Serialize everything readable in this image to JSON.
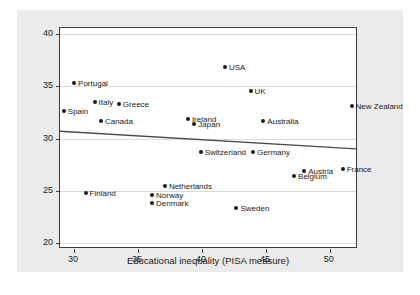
{
  "chart_data": {
    "type": "scatter",
    "title": "",
    "xlabel": "Educational inequality (PISA measure)",
    "ylabel": "Social inequality (Gini index)",
    "xlim": [
      28.9,
      52.2
    ],
    "ylim": [
      19.4,
      40.6
    ],
    "xticks": [
      30,
      35,
      40,
      45,
      50
    ],
    "yticks": [
      20,
      25,
      30,
      35,
      40
    ],
    "grid": "horizontal",
    "legend": "none",
    "points": [
      {
        "label": "Portugal",
        "x": 30.0,
        "y": 35.3,
        "side": "right"
      },
      {
        "label": "Spain",
        "x": 29.2,
        "y": 32.6,
        "side": "right"
      },
      {
        "label": "Italy",
        "x": 31.6,
        "y": 33.5,
        "side": "right"
      },
      {
        "label": "Greece",
        "x": 33.5,
        "y": 33.3,
        "side": "right"
      },
      {
        "label": "Canada",
        "x": 32.1,
        "y": 31.7,
        "side": "right"
      },
      {
        "label": "USA",
        "x": 41.8,
        "y": 36.9,
        "side": "right"
      },
      {
        "label": "UK",
        "x": 43.8,
        "y": 34.6,
        "side": "right"
      },
      {
        "label": "New Zealand",
        "x": 51.7,
        "y": 33.1,
        "side": "right"
      },
      {
        "label": "Ireland",
        "x": 38.9,
        "y": 31.9,
        "side": "right"
      },
      {
        "label": "Japan",
        "x": 39.4,
        "y": 31.4,
        "side": "right"
      },
      {
        "label": "Australia",
        "x": 44.8,
        "y": 31.7,
        "side": "right"
      },
      {
        "label": "Switzerland",
        "x": 39.9,
        "y": 28.7,
        "side": "right"
      },
      {
        "label": "Germany",
        "x": 44.0,
        "y": 28.7,
        "side": "right"
      },
      {
        "label": "Austria",
        "x": 48.0,
        "y": 26.9,
        "side": "right"
      },
      {
        "label": "Belgium",
        "x": 47.2,
        "y": 26.4,
        "side": "right"
      },
      {
        "label": "France",
        "x": 51.0,
        "y": 27.1,
        "side": "right"
      },
      {
        "label": "Netherlands",
        "x": 37.1,
        "y": 25.4,
        "side": "right"
      },
      {
        "label": "Finland",
        "x": 30.9,
        "y": 24.8,
        "side": "right"
      },
      {
        "label": "Norway",
        "x": 36.1,
        "y": 24.6,
        "side": "right"
      },
      {
        "label": "Denmark",
        "x": 36.1,
        "y": 23.8,
        "side": "right"
      },
      {
        "label": "Sweden",
        "x": 42.7,
        "y": 23.3,
        "side": "right"
      }
    ],
    "trendline": {
      "x1": 28.9,
      "y1": 30.6,
      "x2": 52.2,
      "y2": 28.9,
      "color": "#4a4a4a"
    }
  }
}
